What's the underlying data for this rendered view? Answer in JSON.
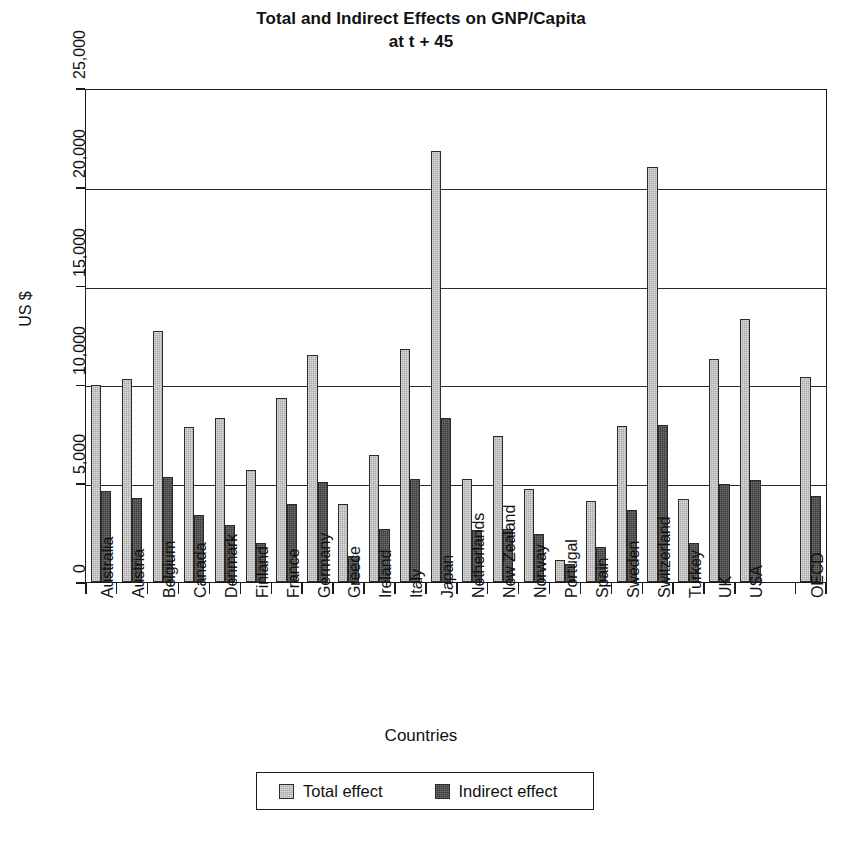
{
  "chart_data": {
    "type": "bar",
    "title": "Total and Indirect Effects on GNP/Capita",
    "subtitle": "at t + 45",
    "xlabel": "Countries",
    "ylabel": "US $",
    "ylim": [
      0,
      25000
    ],
    "yticks": [
      0,
      5000,
      10000,
      15000,
      20000,
      25000
    ],
    "ytick_labels": [
      "0",
      "5,000",
      "10,000",
      "15,000",
      "20,000",
      "25,000"
    ],
    "grid": true,
    "legend_position": "bottom",
    "categories": [
      "Australia",
      "Austria",
      "Belgium",
      "Canada",
      "Denmark",
      "Finland",
      "France",
      "Germany",
      "Greece",
      "Ireland",
      "Italy",
      "Japan",
      "Netherlands",
      "New Zealand",
      "Norway",
      "Portugal",
      "Spain",
      "Sweden",
      "Switzerland",
      "Turkey",
      "UK",
      "USA",
      "OECD"
    ],
    "series": [
      {
        "name": "Total effect",
        "color": "#a9a9a9",
        "values": [
          9950,
          10250,
          12700,
          7850,
          8300,
          5650,
          9300,
          11500,
          3950,
          6450,
          11800,
          21800,
          5200,
          7400,
          4700,
          1100,
          4100,
          7900,
          21000,
          4200,
          11300,
          13300,
          10400
        ]
      },
      {
        "name": "Indirect effect",
        "color": "#3b3b3b",
        "values": [
          4600,
          4250,
          5300,
          3400,
          2900,
          1950,
          3950,
          5050,
          1300,
          2700,
          5200,
          8300,
          2650,
          2700,
          2450,
          900,
          1750,
          3650,
          7950,
          1950,
          4950,
          5150,
          4350
        ]
      }
    ]
  },
  "legend": {
    "items": [
      {
        "label": "Total effect"
      },
      {
        "label": "Indirect effect"
      }
    ]
  }
}
